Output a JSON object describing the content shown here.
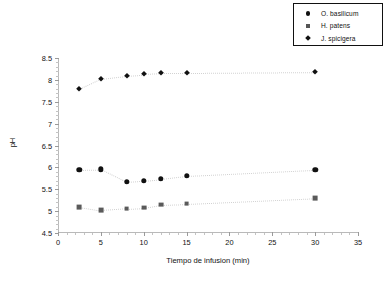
{
  "chart_data": {
    "type": "scatter",
    "title": "",
    "xlabel": "Tiempo de infusion (min)",
    "ylabel": "pH",
    "xlim": [
      0,
      35
    ],
    "ylim": [
      4.5,
      8.5
    ],
    "xticks": [
      0,
      5,
      10,
      15,
      20,
      25,
      30,
      35
    ],
    "yticks": [
      4.5,
      5,
      5.5,
      6,
      6.5,
      7,
      7.5,
      8,
      8.5
    ],
    "xtick_labels": [
      "0",
      "5",
      "10",
      "15",
      "20",
      "25",
      "30",
      "35"
    ],
    "ytick_labels": [
      "4.5",
      "5",
      "5.5",
      "6",
      "6.5",
      "7",
      "7.5",
      "8",
      "8.5"
    ],
    "grid": false,
    "legend_position": "top-right",
    "x": [
      2.5,
      5,
      8,
      10,
      12,
      15,
      30
    ],
    "series": [
      {
        "name": "O. basilicum",
        "marker": "circle",
        "color": "#111111",
        "values": [
          5.95,
          5.96,
          5.67,
          5.7,
          5.74,
          5.81,
          5.95
        ]
      },
      {
        "name": "H. patens",
        "marker": "square",
        "color": "#5a5a5a",
        "values": [
          5.1,
          5.02,
          5.06,
          5.08,
          5.15,
          5.17,
          5.3
        ]
      },
      {
        "name": "J. spicigera",
        "marker": "diamond",
        "color": "#111111",
        "values": [
          7.8,
          8.03,
          8.1,
          8.13,
          8.15,
          8.15,
          8.17
        ]
      }
    ]
  },
  "legend": {
    "entries": [
      {
        "label": "O. basilicum",
        "marker": "circle-marker-icon"
      },
      {
        "label": "H. patens",
        "marker": "square-marker-icon"
      },
      {
        "label": "J. spicigera",
        "marker": "diamond-marker-icon"
      }
    ]
  },
  "axes": {
    "x_title": "Tiempo de infusion (min)",
    "y_title": "pH"
  }
}
